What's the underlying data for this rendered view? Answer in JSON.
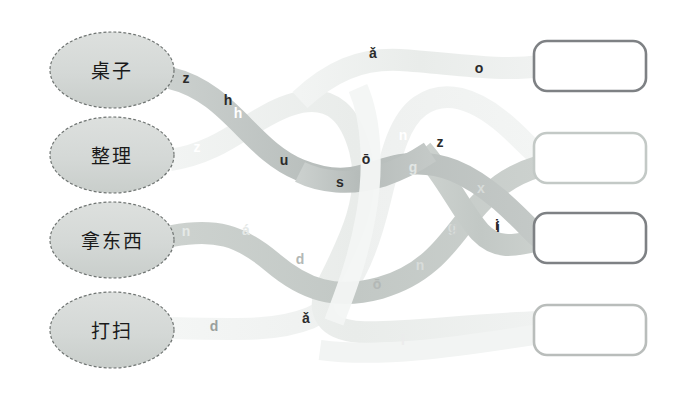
{
  "page": {
    "background_color": "#ffffff",
    "width": 684,
    "height": 393
  },
  "prompts": [
    {
      "id": "prompt-1",
      "label": "桌子",
      "cx": 112,
      "cy": 70,
      "rx": 62,
      "ry": 38
    },
    {
      "id": "prompt-2",
      "label": "整理",
      "cx": 112,
      "cy": 155,
      "rx": 62,
      "ry": 38
    },
    {
      "id": "prompt-3",
      "label": "拿东西",
      "cx": 112,
      "cy": 240,
      "rx": 62,
      "ry": 38
    },
    {
      "id": "prompt-4",
      "label": "打扫",
      "cx": 112,
      "cy": 330,
      "rx": 62,
      "ry": 38
    }
  ],
  "answer_boxes": [
    {
      "id": "answer-box-1",
      "value": "",
      "x": 534,
      "y": 41,
      "width": 112,
      "height": 50,
      "border_color": "#7e8184"
    },
    {
      "id": "answer-box-2",
      "value": "",
      "x": 534,
      "y": 133,
      "width": 112,
      "height": 50,
      "border_color": "#c3c9c6"
    },
    {
      "id": "answer-box-3",
      "value": "",
      "x": 534,
      "y": 213,
      "width": 112,
      "height": 50,
      "border_color": "#7e8184"
    },
    {
      "id": "answer-box-4",
      "value": "",
      "x": 534,
      "y": 305,
      "width": 112,
      "height": 50,
      "border_color": "#b9bdbb"
    }
  ],
  "ribbons": [
    {
      "id": "ribbon-from-zhuozi",
      "source": "桌子",
      "color": "#b9bfbd",
      "width": 22,
      "path": "M170,78 C230,92 250,150 300,170 C350,190 370,170 400,165 C440,158 470,175 500,200 C525,222 535,235 540,238",
      "letters": [
        {
          "char": "z",
          "x": 186,
          "y": 83,
          "color": "#2b2b2b"
        },
        {
          "char": "h",
          "x": 228,
          "y": 105,
          "color": "#2b2b2b"
        },
        {
          "char": "u",
          "x": 284,
          "y": 165,
          "color": "#2b2b2b"
        },
        {
          "char": "s",
          "x": 340,
          "y": 187,
          "color": "#2b2b2b"
        },
        {
          "char": "ō",
          "x": 366,
          "y": 164,
          "color": "#2b2b2b"
        },
        {
          "char": "z",
          "x": 440,
          "y": 147,
          "color": "#2b2b2b"
        },
        {
          "char": "i",
          "x": 497,
          "y": 230,
          "color": "#2b2b2b"
        }
      ]
    },
    {
      "id": "ribbon-from-zhengli",
      "source": "整理",
      "color": "#ebeeec",
      "width": 22,
      "path": "M170,160 C225,152 250,118 290,105 C335,90 352,120 360,150 C372,196 350,240 330,280 C312,315 330,330 360,332 C400,334 460,325 540,322",
      "letters": [
        {
          "char": "z",
          "x": 197,
          "y": 152,
          "color": "#ffffff"
        },
        {
          "char": "h",
          "x": 238,
          "y": 118,
          "color": "#ffffff"
        },
        {
          "char": "ǎ",
          "x": 373,
          "y": 58,
          "color": "#2b2b2b"
        },
        {
          "char": "o",
          "x": 479,
          "y": 73,
          "color": "#2b2b2b"
        },
        {
          "char": "ǎ",
          "x": 306,
          "y": 323,
          "color": "#2b2b2b"
        },
        {
          "char": "l",
          "x": 260,
          "y": 288,
          "color": "#ffffff"
        }
      ]
    },
    {
      "id": "ribbon-from-nadongxi",
      "source": "拿东西",
      "color": "#c7cdca",
      "width": 22,
      "path": "M172,236 C215,228 240,235 272,262 C305,290 335,300 380,288 C430,274 450,240 470,215 C490,190 510,175 540,166",
      "letters": [
        {
          "char": "n",
          "x": 186,
          "y": 236,
          "color": "#e5e9e7"
        },
        {
          "char": "á",
          "x": 246,
          "y": 235,
          "color": "#e5e9e7"
        },
        {
          "char": "d",
          "x": 300,
          "y": 264,
          "color": "#b3b8b6"
        },
        {
          "char": "ō",
          "x": 377,
          "y": 289,
          "color": "#b3b8b6"
        },
        {
          "char": "n",
          "x": 420,
          "y": 270,
          "color": "#d8dcda"
        },
        {
          "char": "g",
          "x": 452,
          "y": 232,
          "color": "#d8dcda"
        },
        {
          "char": "x",
          "x": 481,
          "y": 193,
          "color": "#d8dcda"
        },
        {
          "char": "i",
          "x": 498,
          "y": 232,
          "color": "#2b2b2b"
        }
      ]
    },
    {
      "id": "ribbon-from-dasao",
      "source": "打扫",
      "color": "#f0f2f1",
      "width": 22,
      "path": "M172,328 C250,330 280,330 310,318 C350,300 368,250 380,200 C392,150 400,120 420,106 C445,88 475,100 500,120 C520,136 530,150 540,156",
      "letters": [
        {
          "char": "d",
          "x": 214,
          "y": 331,
          "color": "#9aa09d"
        },
        {
          "char": "é",
          "x": 392,
          "y": 103,
          "color": "#ffffff"
        },
        {
          "char": "n",
          "x": 403,
          "y": 140,
          "color": "#ffffff"
        },
        {
          "char": "g",
          "x": 413,
          "y": 172,
          "color": "#e2e6e4"
        },
        {
          "char": "g",
          "x": 454,
          "y": 232,
          "color": "#c9cecc"
        },
        {
          "char": "i",
          "x": 403,
          "y": 345,
          "color": "#ececec"
        }
      ]
    }
  ],
  "colors": {
    "ellipse_fill": "#d5d9d7",
    "ellipse_stroke": "#6f7472",
    "page_background": "#ffffff",
    "box_fill": "#ffffff"
  }
}
